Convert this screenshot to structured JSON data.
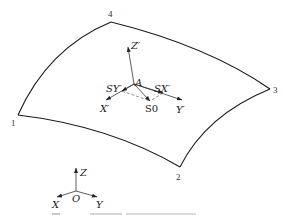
{
  "diagram": {
    "surface": {
      "corners": [
        {
          "id": "1",
          "label": "1",
          "x": 18,
          "y": 115
        },
        {
          "id": "2",
          "label": "2",
          "x": 180,
          "y": 167
        },
        {
          "id": "3",
          "label": "3",
          "x": 270,
          "y": 89
        },
        {
          "id": "4",
          "label": "4",
          "x": 111,
          "y": 22
        }
      ]
    },
    "local_frame": {
      "origin_label": "A",
      "axes": {
        "z": "Z′",
        "x": "X′",
        "y": "Y′"
      },
      "vectors": {
        "sx": "SX′",
        "sy": "SY′",
        "s0": "S0"
      }
    },
    "global_frame": {
      "origin_label": "O",
      "axes": {
        "z": "Z",
        "x": "X",
        "y": "Y"
      }
    },
    "caption": {
      "text": "",
      "note": "caption cropped at bottom edge"
    },
    "colors": {
      "line": "#1a1a1a",
      "text": "#222222",
      "background": "#ffffff"
    }
  }
}
